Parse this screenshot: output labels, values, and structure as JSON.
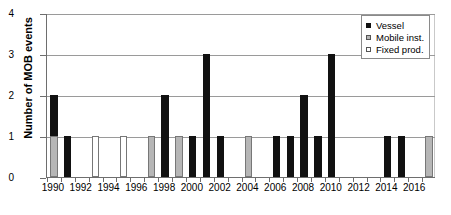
{
  "chart_data": {
    "type": "bar",
    "title": "",
    "xlabel": "",
    "ylabel": "Number of MOB events",
    "ylim": [
      0,
      4
    ],
    "yticks": [
      "0",
      "1",
      "2",
      "3",
      "4"
    ],
    "grid": true,
    "stacked": true,
    "legend_position": "top-right",
    "legend": [
      "Vessel",
      "Mobile inst.",
      "Fixed prod."
    ],
    "colors": {
      "Vessel": "#111111",
      "Mobile inst.": "#b6b6b6",
      "Fixed prod.": "#ffffff",
      "axis": "#6e6e6e",
      "gridline": "#9a9a9a"
    },
    "x": [
      1990,
      1991,
      1992,
      1993,
      1994,
      1995,
      1996,
      1997,
      1998,
      1999,
      2000,
      2001,
      2002,
      2003,
      2004,
      2005,
      2006,
      2007,
      2008,
      2009,
      2010,
      2011,
      2012,
      2013,
      2014,
      2015,
      2016,
      2017
    ],
    "xtick_labels": [
      "1990",
      "1992",
      "1994",
      "1996",
      "1998",
      "2000",
      "2002",
      "2004",
      "2006",
      "2008",
      "2010",
      "2012",
      "2014",
      "2016"
    ],
    "xtick_values": [
      1990,
      1992,
      1994,
      1996,
      1998,
      2000,
      2002,
      2004,
      2006,
      2008,
      2010,
      2012,
      2014,
      2016
    ],
    "series": [
      {
        "name": "Vessel",
        "values": [
          1,
          1,
          0,
          0,
          0,
          0,
          0,
          0,
          2,
          0,
          1,
          3,
          1,
          0,
          0,
          0,
          1,
          1,
          2,
          1,
          3,
          0,
          0,
          0,
          1,
          1,
          0,
          0
        ]
      },
      {
        "name": "Mobile inst.",
        "values": [
          1,
          0,
          0,
          0,
          0,
          0,
          0,
          1,
          0,
          1,
          0,
          0,
          0,
          0,
          1,
          0,
          0,
          0,
          0,
          0,
          0,
          0,
          0,
          0,
          0,
          0,
          0,
          1
        ]
      },
      {
        "name": "Fixed prod.",
        "values": [
          0,
          0,
          0,
          1,
          0,
          1,
          0,
          0,
          0,
          0,
          0,
          0,
          0,
          0,
          0,
          0,
          0,
          0,
          0,
          0,
          0,
          0,
          0,
          0,
          0,
          0,
          0,
          0
        ]
      }
    ],
    "totals": [
      2,
      1,
      0,
      1,
      0,
      1,
      0,
      1,
      2,
      1,
      1,
      3,
      1,
      0,
      1,
      0,
      1,
      1,
      2,
      1,
      3,
      0,
      0,
      0,
      1,
      1,
      0,
      1
    ]
  }
}
